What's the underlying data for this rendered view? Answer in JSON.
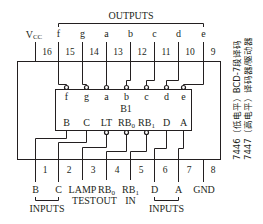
{
  "chip": {
    "label": "B1",
    "title_line1": "7446（低电平）BCD-7段译码",
    "title_line2": "7447（高电平）译码器/驱动器"
  },
  "group_labels": {
    "outputs": "OUTPUTS",
    "inputs_left": "INPUTS",
    "inputs_right": "INPUTS"
  },
  "top_pins": [
    {
      "number": "16",
      "name": "Vcc",
      "external": "V",
      "external_sub": "CC",
      "internal": ""
    },
    {
      "number": "15",
      "name": "f",
      "external": "f",
      "internal": "f",
      "inverted": true
    },
    {
      "number": "14",
      "name": "g",
      "external": "g",
      "internal": "g",
      "inverted": true
    },
    {
      "number": "13",
      "name": "a",
      "external": "a",
      "internal": "a",
      "inverted": true
    },
    {
      "number": "12",
      "name": "b",
      "external": "b",
      "internal": "b",
      "inverted": true
    },
    {
      "number": "11",
      "name": "c",
      "external": "c",
      "internal": "c",
      "inverted": true
    },
    {
      "number": "10",
      "name": "d",
      "external": "d",
      "internal": "d",
      "inverted": true
    },
    {
      "number": "9",
      "name": "e",
      "external": "e",
      "internal": "e",
      "inverted": true
    }
  ],
  "bottom_pins": [
    {
      "number": "1",
      "external": "B",
      "internal": "B",
      "inverted": false
    },
    {
      "number": "2",
      "external": "C",
      "internal": "C",
      "inverted": false
    },
    {
      "number": "3",
      "external": "LAMP",
      "external2": "TEST",
      "internal": "LT",
      "inverted": true
    },
    {
      "number": "4",
      "external": "RB",
      "external_sub": "0",
      "external2": "OUT",
      "internal": "RB",
      "internal_sub": "0",
      "inverted": true
    },
    {
      "number": "5",
      "external": "RB",
      "external_sub": "1",
      "external2": "IN",
      "internal": "RB",
      "internal_sub": "1",
      "inverted": true
    },
    {
      "number": "6",
      "external": "D",
      "internal": "D",
      "inverted": false
    },
    {
      "number": "7",
      "external": "A",
      "internal": "A",
      "inverted": false
    },
    {
      "number": "8",
      "external": "GND",
      "internal": "",
      "inverted": false
    }
  ],
  "colors": {
    "ink": "#231f20",
    "background": "#ffffff"
  }
}
